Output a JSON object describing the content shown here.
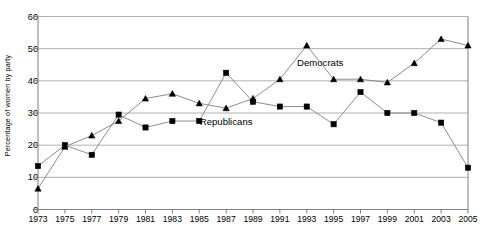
{
  "chart_data": {
    "type": "line",
    "title": "",
    "xlabel": "",
    "ylabel": "Percentage of women by party",
    "x": [
      1973,
      1975,
      1977,
      1979,
      1981,
      1983,
      1985,
      1987,
      1989,
      1991,
      1993,
      1995,
      1997,
      1999,
      2001,
      2003,
      2005
    ],
    "categories": [
      "1973",
      "1975",
      "1977",
      "1979",
      "1981",
      "1983",
      "1985",
      "1987",
      "1989",
      "1991",
      "1993",
      "1995",
      "1997",
      "1999",
      "2001",
      "2003",
      "2005"
    ],
    "xlim": [
      1973,
      2005
    ],
    "ylim": [
      0,
      60
    ],
    "yticks": [
      0,
      10,
      20,
      30,
      40,
      50,
      60
    ],
    "grid": true,
    "legend_position": "inline-annotation",
    "series": [
      {
        "name": "Republicans",
        "marker": "square",
        "color": "#000000",
        "line_color": "#808080",
        "label_x": 1987,
        "label_y": 27.5,
        "values": [
          13.5,
          20.0,
          17.0,
          29.5,
          25.5,
          27.5,
          27.5,
          42.5,
          33.5,
          32.0,
          32.0,
          26.5,
          36.5,
          30.0,
          30.0,
          27.0,
          13.0
        ]
      },
      {
        "name": "Democrats",
        "marker": "triangle",
        "color": "#000000",
        "line_color": "#808080",
        "label_x": 1994,
        "label_y": 46.0,
        "values": [
          6.5,
          19.5,
          23.0,
          27.5,
          34.5,
          36.0,
          33.0,
          31.5,
          34.5,
          40.5,
          51.0,
          40.5,
          40.5,
          39.5,
          45.5,
          53.0,
          51.0
        ]
      }
    ],
    "annotations": [
      {
        "text": "Democrats",
        "x": 1994,
        "y": 46.0
      },
      {
        "text": "Republicans",
        "x": 1987,
        "y": 27.5
      }
    ]
  },
  "axis": {
    "y_tick_labels": [
      "0",
      "10",
      "20",
      "30",
      "40",
      "50",
      "60"
    ],
    "x_tick_labels": [
      "1973",
      "1975",
      "1977",
      "1979",
      "1981",
      "1983",
      "1985",
      "1987",
      "1989",
      "1991",
      "1993",
      "1995",
      "1997",
      "1999",
      "2001",
      "2003",
      "2005"
    ],
    "y_axis_title": "Percentage of women by party"
  },
  "style": {
    "grid_color": "#b0b0b0",
    "axis_color": "#808080",
    "line_color": "#8c8c8c",
    "marker_color": "#000000",
    "background": "#ffffff"
  }
}
